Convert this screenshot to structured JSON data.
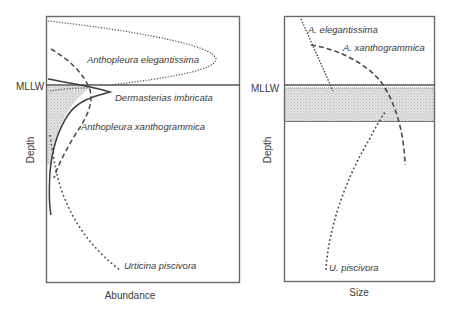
{
  "figure": {
    "left_panel": {
      "x_axis_label": "Abundance",
      "y_axis_label": "Depth",
      "reference_line_label": "MLLW",
      "species": [
        {
          "name": "Anthopleura elegantissima",
          "line_style": "dotted"
        },
        {
          "name": "Dermasterias imbricata",
          "line_style": "solid"
        },
        {
          "name": "Anthopleura xanthogrammica",
          "line_style": "dashed"
        },
        {
          "name": "Urticina piscivora",
          "line_style": "dotted"
        }
      ]
    },
    "right_panel": {
      "x_axis_label": "Size",
      "y_axis_label": "Depth",
      "reference_line_label": "MLLW",
      "species": [
        {
          "name": "A. elegantissima",
          "line_style": "dotted"
        },
        {
          "name": "A. xanthogrammica",
          "line_style": "dashed"
        },
        {
          "name": "U. piscivora",
          "line_style": "dotted"
        }
      ]
    },
    "shaded_band": "intertidal zone just below MLLW (stippled grey)",
    "colors": {
      "line": "#4a4a4a",
      "frame": "#6a6a6a",
      "shade": "#d9d9d9",
      "background": "#ffffff"
    }
  }
}
